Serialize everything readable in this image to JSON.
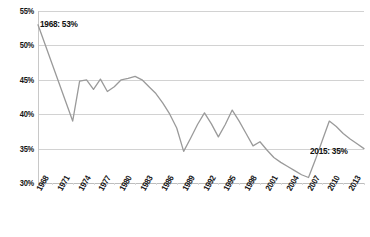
{
  "chart_data": {
    "type": "line",
    "title": "",
    "xlabel": "",
    "ylabel": "",
    "ylim": [
      30,
      55
    ],
    "xlim": [
      1968,
      2015
    ],
    "grid": true,
    "legend": false,
    "line_color": "#9a9a9a",
    "ytick_labels": [
      "55%",
      "50%",
      "45%",
      "40%",
      "35%",
      "30%"
    ],
    "ytick_values": [
      55,
      50,
      45,
      40,
      35,
      30
    ],
    "xtick_labels": [
      "1968",
      "1971",
      "1974",
      "1977",
      "1980",
      "1983",
      "1986",
      "1989",
      "1992",
      "1995",
      "1998",
      "2001",
      "2004",
      "2007",
      "2010",
      "2013"
    ],
    "xtick_values": [
      1968,
      1971,
      1974,
      1977,
      1980,
      1983,
      1986,
      1989,
      1992,
      1995,
      1998,
      2001,
      2004,
      2007,
      2010,
      2013
    ],
    "x": [
      1968,
      1969,
      1970,
      1971,
      1972,
      1973,
      1974,
      1975,
      1976,
      1977,
      1978,
      1979,
      1980,
      1981,
      1982,
      1983,
      1984,
      1985,
      1986,
      1987,
      1988,
      1989,
      1990,
      1991,
      1992,
      1993,
      1994,
      1995,
      1996,
      1997,
      1998,
      1999,
      2000,
      2001,
      2002,
      2003,
      2004,
      2005,
      2006,
      2007,
      2008,
      2009,
      2010,
      2011,
      2012,
      2013,
      2014,
      2015
    ],
    "values": [
      53.0,
      50.2,
      47.4,
      44.6,
      41.8,
      39.0,
      44.8,
      45.0,
      43.6,
      45.1,
      43.3,
      44.0,
      45.0,
      45.2,
      45.5,
      45.0,
      44.0,
      43.0,
      41.6,
      40.0,
      38.0,
      34.6,
      36.5,
      38.5,
      40.2,
      38.6,
      36.7,
      38.5,
      40.6,
      39.0,
      37.2,
      35.4,
      36.0,
      34.8,
      33.7,
      33.0,
      32.4,
      31.8,
      31.2,
      30.8,
      33.4,
      36.2,
      39.0,
      38.2,
      37.2,
      36.4,
      35.7,
      35.0
    ],
    "annotations": [
      {
        "name": "start-point",
        "text": "1968: 53%",
        "year": 1968,
        "value": 53
      },
      {
        "name": "end-point",
        "text": "2015: 35%",
        "year": 2015,
        "value": 35
      }
    ]
  }
}
